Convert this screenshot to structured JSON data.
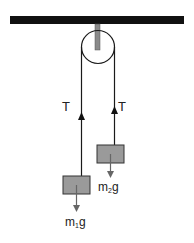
{
  "diagram": {
    "labels": {
      "tension_left": "T",
      "tension_right": "T",
      "weight_left_m": "m",
      "weight_left_sub": "1",
      "weight_left_g": "g",
      "weight_right_m": "m",
      "weight_right_sub": "2",
      "weight_right_g": "g"
    },
    "colors": {
      "ceiling": "#111111",
      "rod": "#8a8a8a",
      "rope": "#1a1a1a",
      "block_fill": "#9a9a9a",
      "block_stroke": "#333333",
      "weight_arrow": "#666666"
    }
  }
}
